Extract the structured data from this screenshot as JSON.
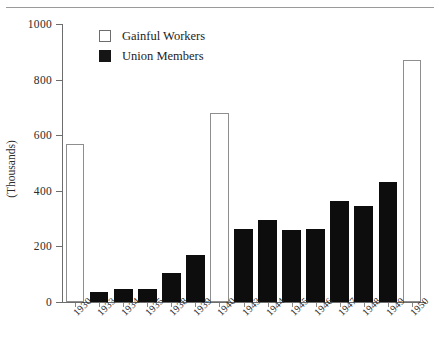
{
  "chart_data": {
    "type": "bar",
    "title": "",
    "subtitle": "",
    "xlabel": "",
    "ylabel": "(Thousands)",
    "ylim": [
      0,
      1000
    ],
    "yticks": [
      0,
      200,
      400,
      600,
      800,
      1000
    ],
    "ytick_labels": [
      "0",
      "200",
      "400",
      "600",
      "800",
      "1000"
    ],
    "grid": false,
    "legend_position": "top-left-inside",
    "categories": [
      "1930",
      "1933",
      "1934",
      "1935",
      "1938",
      "1939",
      "1940",
      "1943",
      "1944",
      "1945",
      "1946",
      "1947",
      "1948",
      "1949",
      "1950"
    ],
    "series": [
      {
        "name": "Gainful Workers",
        "color": "#ffffff",
        "values": [
          570,
          null,
          null,
          null,
          null,
          null,
          680,
          null,
          null,
          null,
          null,
          null,
          null,
          null,
          870
        ]
      },
      {
        "name": "Union Members",
        "color": "#0d0d0d",
        "values": [
          null,
          35,
          45,
          48,
          105,
          168,
          null,
          262,
          295,
          258,
          262,
          365,
          345,
          430,
          null
        ]
      }
    ],
    "bars": [
      {
        "category": "1930",
        "value": 570,
        "series": "Gainful Workers"
      },
      {
        "category": "1933",
        "value": 35,
        "series": "Union Members"
      },
      {
        "category": "1934",
        "value": 45,
        "series": "Union Members"
      },
      {
        "category": "1935",
        "value": 48,
        "series": "Union Members"
      },
      {
        "category": "1938",
        "value": 105,
        "series": "Union Members"
      },
      {
        "category": "1939",
        "value": 168,
        "series": "Union Members"
      },
      {
        "category": "1940",
        "value": 680,
        "series": "Gainful Workers"
      },
      {
        "category": "1943",
        "value": 262,
        "series": "Union Members"
      },
      {
        "category": "1944",
        "value": 295,
        "series": "Union Members"
      },
      {
        "category": "1945",
        "value": 258,
        "series": "Union Members"
      },
      {
        "category": "1946",
        "value": 262,
        "series": "Union Members"
      },
      {
        "category": "1947",
        "value": 365,
        "series": "Union Members"
      },
      {
        "category": "1948",
        "value": 345,
        "series": "Union Members"
      },
      {
        "category": "1949",
        "value": 430,
        "series": "Union Members"
      },
      {
        "category": "1950",
        "value": 870,
        "series": "Gainful Workers"
      }
    ]
  },
  "legend": {
    "items": [
      {
        "label": "Gainful Workers",
        "swatch": "open-square"
      },
      {
        "label": "Union Members",
        "swatch": "filled-square"
      }
    ]
  },
  "colors": {
    "union_fill": "#0d0d0d",
    "gainful_fill": "#ffffff",
    "axis": "#6d6d6d",
    "text": "#1d1d1d",
    "background": "#ffffff"
  }
}
